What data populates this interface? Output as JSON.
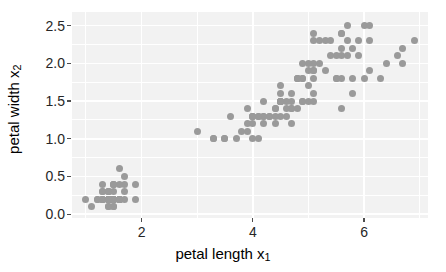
{
  "chart_data": {
    "type": "scatter",
    "title": "",
    "xlabel": "petal length x₁",
    "xlabel_text": "petal length x",
    "xlabel_sub": "1",
    "ylabel": "petal width x₂",
    "ylabel_text": "petal width x",
    "ylabel_sub": "2",
    "xlim": [
      0.75,
      7.15
    ],
    "ylim": [
      -0.05,
      2.68
    ],
    "xticks": [
      2,
      4,
      6
    ],
    "xticklabels": [
      "2",
      "4",
      "6"
    ],
    "yticks": [
      0.0,
      0.5,
      1.0,
      1.5,
      2.0,
      2.5
    ],
    "yticklabels": [
      "0.0",
      "0.5",
      "1.0",
      "1.5",
      "2.0",
      "2.5"
    ],
    "x_minor_ticks": [
      1,
      3,
      5,
      7
    ],
    "y_minor_ticks": [
      0.25,
      0.75,
      1.25,
      1.75,
      2.25
    ],
    "grid": true,
    "grid_color": "#ffffff",
    "panel_background": "#f2f2f2",
    "point_color": "#9a9a9a",
    "point_size": 7,
    "legend": "none",
    "n_points": 150,
    "x": [
      1.4,
      1.4,
      1.3,
      1.5,
      1.4,
      1.7,
      1.4,
      1.5,
      1.4,
      1.5,
      1.5,
      1.6,
      1.4,
      1.1,
      1.2,
      1.5,
      1.3,
      1.4,
      1.7,
      1.5,
      1.7,
      1.5,
      1.0,
      1.7,
      1.9,
      1.6,
      1.6,
      1.5,
      1.4,
      1.6,
      1.6,
      1.5,
      1.5,
      1.4,
      1.5,
      1.2,
      1.3,
      1.4,
      1.3,
      1.5,
      1.3,
      1.3,
      1.3,
      1.6,
      1.9,
      1.4,
      1.6,
      1.4,
      1.5,
      1.4,
      4.7,
      4.5,
      4.9,
      4.0,
      4.6,
      4.5,
      4.7,
      3.3,
      4.6,
      3.9,
      3.5,
      4.2,
      4.0,
      4.7,
      3.6,
      4.4,
      4.5,
      4.1,
      4.5,
      3.9,
      4.8,
      4.0,
      4.9,
      4.7,
      4.3,
      4.4,
      4.8,
      5.0,
      4.5,
      3.5,
      3.8,
      3.7,
      3.9,
      5.1,
      4.5,
      4.5,
      4.7,
      4.4,
      4.1,
      4.0,
      4.4,
      4.6,
      4.0,
      3.3,
      4.2,
      4.2,
      4.2,
      4.3,
      3.0,
      4.1,
      6.0,
      5.1,
      5.9,
      5.6,
      5.8,
      6.6,
      4.5,
      6.3,
      5.8,
      6.1,
      5.1,
      5.3,
      5.5,
      5.0,
      5.1,
      5.3,
      5.5,
      6.7,
      6.9,
      5.0,
      5.7,
      4.9,
      6.7,
      4.9,
      5.7,
      6.0,
      4.8,
      4.9,
      5.6,
      5.8,
      6.1,
      6.4,
      5.6,
      5.1,
      5.6,
      6.1,
      5.6,
      5.5,
      4.8,
      5.4,
      5.6,
      5.1,
      5.1,
      5.9,
      5.7,
      5.2,
      5.0,
      5.2,
      5.4,
      5.1
    ],
    "y": [
      0.2,
      0.2,
      0.2,
      0.2,
      0.2,
      0.4,
      0.3,
      0.2,
      0.2,
      0.1,
      0.2,
      0.2,
      0.1,
      0.1,
      0.2,
      0.4,
      0.4,
      0.3,
      0.3,
      0.3,
      0.2,
      0.4,
      0.2,
      0.5,
      0.2,
      0.2,
      0.4,
      0.2,
      0.2,
      0.2,
      0.2,
      0.4,
      0.1,
      0.2,
      0.2,
      0.2,
      0.2,
      0.1,
      0.2,
      0.2,
      0.3,
      0.3,
      0.2,
      0.6,
      0.4,
      0.3,
      0.2,
      0.2,
      0.2,
      0.2,
      1.4,
      1.5,
      1.5,
      1.3,
      1.5,
      1.3,
      1.6,
      1.0,
      1.3,
      1.4,
      1.0,
      1.5,
      1.0,
      1.4,
      1.3,
      1.4,
      1.5,
      1.0,
      1.5,
      1.1,
      1.8,
      1.3,
      1.5,
      1.2,
      1.3,
      1.4,
      1.4,
      1.7,
      1.5,
      1.0,
      1.1,
      1.0,
      1.2,
      1.6,
      1.5,
      1.6,
      1.5,
      1.3,
      1.3,
      1.3,
      1.2,
      1.4,
      1.2,
      1.0,
      1.3,
      1.2,
      1.3,
      1.3,
      1.1,
      1.3,
      2.5,
      1.9,
      2.1,
      1.8,
      2.2,
      2.1,
      1.7,
      1.8,
      1.8,
      2.5,
      2.0,
      1.9,
      2.1,
      2.0,
      2.4,
      2.3,
      1.8,
      2.2,
      2.3,
      1.5,
      2.3,
      2.0,
      2.0,
      1.8,
      2.1,
      1.8,
      1.8,
      1.8,
      2.1,
      1.6,
      1.9,
      2.0,
      2.2,
      1.5,
      1.4,
      2.3,
      2.4,
      1.8,
      1.8,
      2.1,
      2.4,
      2.3,
      1.9,
      2.3,
      2.5,
      2.3,
      1.9,
      2.0,
      2.3,
      1.8
    ]
  }
}
